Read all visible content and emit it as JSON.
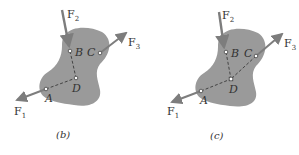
{
  "figure": {
    "panels": [
      {
        "caption": "(b)",
        "points": {
          "A": "A",
          "B": "B",
          "C": "C",
          "D": "D"
        },
        "forces": {
          "F1": {
            "main": "F",
            "sub": "1"
          },
          "F2": {
            "main": "F",
            "sub": "2"
          },
          "F3": {
            "main": "F",
            "sub": "3"
          }
        },
        "description": "Lines of action of F1 and F2 extended to intersect at D; F3 acts at C"
      },
      {
        "caption": "(c)",
        "points": {
          "A": "A",
          "B": "B",
          "C": "C",
          "D": "D"
        },
        "forces": {
          "F1": {
            "main": "F",
            "sub": "1"
          },
          "F2": {
            "main": "F",
            "sub": "2"
          },
          "F3": {
            "main": "F",
            "sub": "3"
          }
        },
        "description": "Lines of action of F1, F2 and F3 all pass through concurrent point D"
      }
    ],
    "colors": {
      "body": "#9a9a9a",
      "arrow": "#7d7d7d",
      "dashed": "#3a3a3a",
      "label": "#333333"
    }
  }
}
